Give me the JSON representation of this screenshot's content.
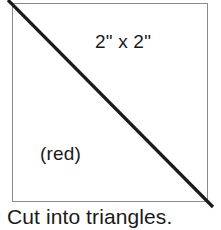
{
  "diagram": {
    "shape": {
      "name": "square",
      "size_label": "2\" x 2\"",
      "color_label": "(red)",
      "border_color": "#8a8a8a",
      "fill_color": "#ffffff"
    },
    "cut_line": {
      "name": "diagonal-cut-line",
      "color": "#1a1a1a",
      "from": "top-left",
      "to": "bottom-right"
    },
    "caption": "Cut into triangles."
  }
}
